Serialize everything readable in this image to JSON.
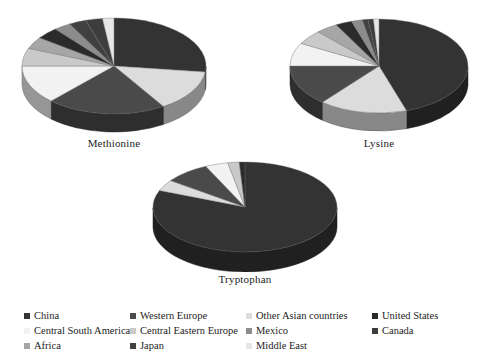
{
  "figure": {
    "background": "#ffffff",
    "type": "pie-chart-group",
    "chart_count": 3
  },
  "palette": {
    "China": "#333333",
    "Western Europe": "#4a4a4a",
    "Other Asian countries": "#dcdcdc",
    "United States": "#2b2b2b",
    "Central South America": "#f2f2f2",
    "Central Eastern Europe": "#c9c9c9",
    "Mexico": "#8c8c8c",
    "Canada": "#3d3d3d",
    "Africa": "#a6a6a6",
    "Japan": "#404040",
    "Middle East": "#e6e6e6"
  },
  "legend": {
    "name": "region-legend",
    "columns": 4,
    "items": [
      {
        "label": "China",
        "color": "#333333"
      },
      {
        "label": "Western Europe",
        "color": "#4a4a4a"
      },
      {
        "label": "Other Asian countries",
        "color": "#dcdcdc"
      },
      {
        "label": "United States",
        "color": "#2b2b2b"
      },
      {
        "label": "Central South America",
        "color": "#f2f2f2"
      },
      {
        "label": "Central Eastern Europe",
        "color": "#c9c9c9"
      },
      {
        "label": "Mexico",
        "color": "#8c8c8c"
      },
      {
        "label": "Canada",
        "color": "#3d3d3d"
      },
      {
        "label": "Africa",
        "color": "#a6a6a6"
      },
      {
        "label": "Japan",
        "color": "#404040"
      },
      {
        "label": "Middle East",
        "color": "#e6e6e6"
      },
      {
        "label": "",
        "color": ""
      }
    ]
  },
  "chart_data": [
    {
      "type": "pie",
      "title": "Methionine",
      "labels": [
        "China",
        "Other Asian countries",
        "Western Europe",
        "Central South America",
        "Central Eastern Europe",
        "Africa",
        "United States",
        "Mexico",
        "Japan",
        "Canada",
        "Middle East"
      ],
      "values": [
        27,
        14,
        21,
        13,
        6,
        4,
        4,
        3,
        3,
        3,
        2
      ],
      "unit": "%",
      "start_angle": 0,
      "direction": "clockwise",
      "three_d": true,
      "legend_position": "bottom"
    },
    {
      "type": "pie",
      "title": "Lysine",
      "labels": [
        "China",
        "Other Asian countries",
        "Western Europe",
        "Central South America",
        "Central Eastern Europe",
        "Africa",
        "United States",
        "Mexico",
        "Japan",
        "Canada",
        "Middle East"
      ],
      "values": [
        45,
        16,
        14,
        8,
        5,
        4,
        3,
        2,
        1,
        1,
        1
      ],
      "unit": "%",
      "start_angle": 0,
      "direction": "clockwise",
      "three_d": true,
      "legend_position": "bottom"
    },
    {
      "type": "pie",
      "title": "Tryptophan",
      "labels": [
        "China",
        "Other Asian countries",
        "Western Europe",
        "Central South America",
        "Central Eastern Europe",
        "United States"
      ],
      "values": [
        81,
        4,
        8,
        4,
        2,
        1
      ],
      "unit": "%",
      "start_angle": 0,
      "direction": "clockwise",
      "three_d": true,
      "legend_position": "bottom"
    }
  ],
  "charts": [
    {
      "name": "methionine-pie",
      "caption": "Methionine"
    },
    {
      "name": "lysine-pie",
      "caption": "Lysine"
    },
    {
      "name": "tryptophan-pie",
      "caption": "Tryptophan"
    }
  ]
}
